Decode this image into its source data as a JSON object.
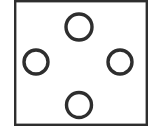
{
  "figure": {
    "canvas": {
      "width": 154,
      "height": 135
    },
    "background_color": "#ffffff",
    "stroke_color": "#2e2e2e",
    "frame": {
      "label": "rectangular outline frame",
      "x": 14,
      "y": 0,
      "width": 134,
      "height": 126,
      "stroke_width": 2.4,
      "fill": "#ffffff",
      "stroke_color": "#2e2e2e"
    },
    "circles": [
      {
        "id": "circle-top",
        "label": "top circle",
        "cx": 79,
        "cy": 27,
        "r": 13,
        "stroke_width": 3.4,
        "stroke_color": "#2e2e2e",
        "fill": "none"
      },
      {
        "id": "circle-left",
        "label": "left circle",
        "cx": 36,
        "cy": 62,
        "r": 12,
        "stroke_width": 3.4,
        "stroke_color": "#2e2e2e",
        "fill": "none"
      },
      {
        "id": "circle-right",
        "label": "right circle",
        "cx": 120,
        "cy": 62,
        "r": 12,
        "stroke_width": 3.4,
        "stroke_color": "#2e2e2e",
        "fill": "none"
      },
      {
        "id": "circle-bottom",
        "label": "bottom circle",
        "cx": 79,
        "cy": 105,
        "r": 12.5,
        "stroke_width": 3.4,
        "stroke_color": "#2e2e2e",
        "fill": "none"
      }
    ],
    "circle_count": 4
  }
}
